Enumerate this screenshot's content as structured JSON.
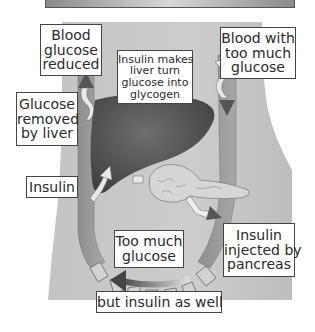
{
  "diagram": {
    "labels": {
      "blood_glucose_reduced": [
        "Blood",
        "glucose",
        "reduced"
      ],
      "insulin_makes_liver": [
        "Insulin makes",
        "liver turn",
        "glucose into",
        "glycogen"
      ],
      "blood_too_much_glucose": [
        "Blood with",
        "too much",
        "glucose"
      ],
      "glucose_removed_by_liver": [
        "Glucose",
        "removed",
        "by liver"
      ],
      "insulin": [
        "Insulin"
      ],
      "too_much_glucose": [
        "Too much",
        "glucose"
      ],
      "insulin_injected_by_pancreas": [
        "Insulin",
        "injected by",
        "pancreas"
      ],
      "but_insulin_as_well": [
        "but insulin as well"
      ]
    },
    "organs": [
      "liver",
      "pancreas"
    ],
    "colors": {
      "body": "#c9c9c9",
      "liver": "#5a5a5a",
      "vessel": "#9a9a9a",
      "pancreas": "#d8d8d8",
      "label_border": "#444444"
    }
  }
}
